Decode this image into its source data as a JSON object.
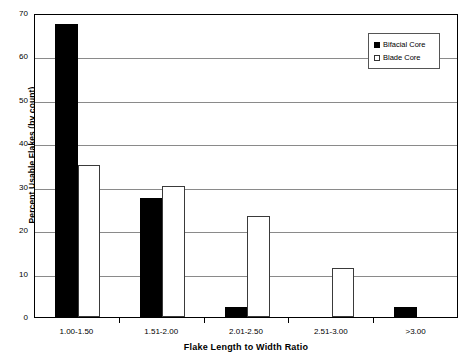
{
  "chart_data": {
    "type": "bar",
    "title": "",
    "xlabel": "Flake Length to Width Ratio",
    "ylabel": "Percent Usable Flakes (by count)",
    "categories": [
      "1.00-1.50",
      "1.51-2.00",
      "2.01-2.50",
      "2.51-3.00",
      ">3.00"
    ],
    "series": [
      {
        "name": "Bifacial Core",
        "values": [
          67.5,
          27.3,
          2.4,
          0,
          2.2
        ],
        "style": "filled",
        "color": "#000000"
      },
      {
        "name": "Blade Core",
        "values": [
          35.0,
          30.2,
          23.2,
          11.3,
          0
        ],
        "style": "open",
        "color": "#ffffff"
      }
    ],
    "ylim": [
      0,
      70
    ],
    "yticks": [
      0,
      10,
      20,
      30,
      40,
      50,
      60,
      70
    ],
    "ytick_labels": [
      "0",
      "10",
      "20",
      "30",
      "40",
      "50",
      "60",
      "70"
    ],
    "grid": true,
    "grid_axis": "y",
    "legend_position": "top-right",
    "legend_entries": [
      "Bifacial Core",
      "Blade Core"
    ]
  },
  "legend": {
    "items": [
      {
        "label": "Bifacial Core",
        "style": "filled"
      },
      {
        "label": "Blade Core",
        "style": "open"
      }
    ]
  }
}
